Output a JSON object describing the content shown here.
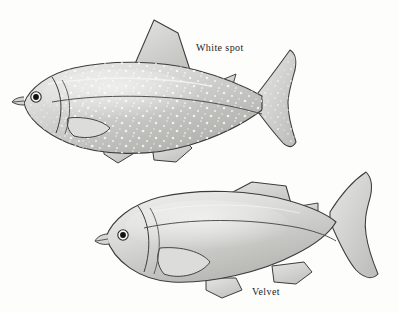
{
  "figure": {
    "background_color": "#fdfdfc",
    "ink_color": "#3a3a3a",
    "body_fill_light": "#e3e3e1",
    "body_fill_mid": "#c9c9c7",
    "body_fill_dark": "#a9a9a6",
    "fin_fill": "#d8d8d6",
    "spot_color": "#fbfbfa",
    "eye_color": "#111111"
  },
  "labels": {
    "white_spot": "White spot",
    "velvet": "Velvet"
  },
  "specimens": [
    {
      "id": "upper-fish",
      "condition_label": "White spot",
      "markings": "dense small white spots over body, fins and tail",
      "has_spots": true
    },
    {
      "id": "lower-fish",
      "condition_label": "Velvet",
      "markings": "smooth dusty sheen, no discrete spots",
      "has_spots": false
    }
  ],
  "anatomy": {
    "parts": [
      "eye",
      "mouth",
      "gill-cover",
      "pectoral-fin",
      "pelvic-fin",
      "dorsal-fin",
      "anal-fin",
      "adipose-fin",
      "caudal-fin",
      "lateral-line"
    ]
  }
}
